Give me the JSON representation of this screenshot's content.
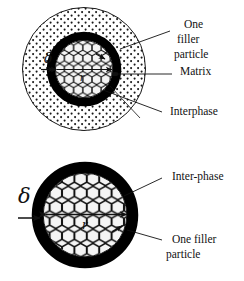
{
  "figure": {
    "colors": {
      "ink": "#121212",
      "interphase_ring": "#000000",
      "matrix_fill": "#ffffff",
      "filler_fill": "#f2f2f2",
      "background": "#ffffff"
    },
    "panels": [
      {
        "id": "top-panel",
        "name": "filler-particle-in-matrix",
        "shapes": [
          {
            "name": "matrix-circle",
            "kind": "circle",
            "cx": 84,
            "cy": 69,
            "r": 62,
            "fill": "stipple-dots",
            "stroke": "#121212"
          },
          {
            "name": "interphase-ring",
            "kind": "annulus",
            "cx": 84,
            "cy": 69,
            "r_outer": 37,
            "r_inner": 29,
            "fill": "#000000"
          },
          {
            "name": "filler-particle-core",
            "kind": "circle",
            "cx": 84,
            "cy": 69,
            "r": 29,
            "fill": "hexagon-honeycomb"
          }
        ],
        "dimensions": [
          {
            "name": "radius-arrow",
            "label": "r",
            "from": [
              84,
              69
            ],
            "to": [
              112,
              69
            ]
          },
          {
            "name": "delta-arrow",
            "label": "δ",
            "from": [
              44,
              69
            ],
            "to": [
              56,
              69
            ]
          }
        ],
        "labels": [
          {
            "name": "label-one-filler-particle",
            "lines": [
              "One",
              "filler",
              "particle"
            ],
            "x": 178,
            "y": 24,
            "leader_from": [
              170,
              32
            ],
            "leader_to": [
              122,
              48
            ]
          },
          {
            "name": "label-matrix",
            "lines": [
              "Matrix"
            ],
            "x": 178,
            "y": 68,
            "leader_from": [
              172,
              74
            ],
            "leader_to": [
              116,
              74
            ]
          },
          {
            "name": "label-interphase",
            "lines": [
              "Interphase"
            ],
            "x": 166,
            "y": 112,
            "leader_from": [
              160,
              113
            ],
            "leader_to": [
              104,
              91
            ]
          }
        ]
      },
      {
        "id": "bottom-panel",
        "name": "filler-particle-with-interphase",
        "shapes": [
          {
            "name": "interphase-ring",
            "kind": "annulus",
            "cx": 85,
            "cy": 215,
            "r_outer": 53,
            "r_inner": 42,
            "fill": "#000000"
          },
          {
            "name": "filler-particle-core",
            "kind": "circle",
            "cx": 85,
            "cy": 215,
            "r": 42,
            "fill": "hexagon-honeycomb"
          }
        ],
        "dimensions": [
          {
            "name": "radius-arrow",
            "label": "r",
            "from": [
              85,
              215
            ],
            "to": [
              126,
              215
            ]
          },
          {
            "name": "delta-arrow",
            "label": "δ",
            "from": [
              22,
              218
            ],
            "to": [
              40,
              218
            ]
          }
        ],
        "labels": [
          {
            "name": "label-inter-phase",
            "lines": [
              "Inter-phase"
            ],
            "x": 166,
            "y": 176,
            "leader_from": [
              160,
              180
            ],
            "leader_to": [
              126,
              196
            ]
          },
          {
            "name": "label-one-filler-particle",
            "lines": [
              "One filler",
              "particle"
            ],
            "x": 166,
            "y": 239,
            "leader_from": [
              160,
              241
            ],
            "leader_to": [
              128,
              230
            ]
          }
        ]
      }
    ],
    "text": {
      "one": "One",
      "filler": "filler",
      "particle": "particle",
      "matrix": "Matrix",
      "interphase": "Interphase",
      "inter_phase": "Inter-phase",
      "one_filler": "One filler",
      "particle2": "particle",
      "delta": "δ",
      "radius": "r"
    }
  }
}
